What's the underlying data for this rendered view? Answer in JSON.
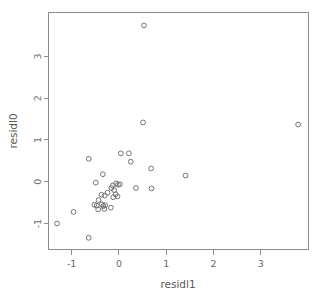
{
  "chart_data": {
    "type": "scatter",
    "title": "",
    "xlabel": "residl1",
    "ylabel": "residl0",
    "xlim": [
      -1.49,
      4.01
    ],
    "ylim": [
      -1.62,
      4.05
    ],
    "xticks": [
      -1,
      0,
      1,
      2,
      3
    ],
    "xtick_labels": [
      "-1",
      "0",
      "1",
      "2",
      "3"
    ],
    "yticks": [
      -1,
      0,
      1,
      2,
      3
    ],
    "ytick_labels": [
      "-1",
      "0",
      "1",
      "2",
      "3"
    ],
    "grid": false,
    "legend": null,
    "marker": "open-circle",
    "marker_color": "#6e6e6e",
    "n_points": 35,
    "points": [
      {
        "x": 0.53,
        "y": 3.74
      },
      {
        "x": 3.79,
        "y": 1.37
      },
      {
        "x": 0.51,
        "y": 1.42
      },
      {
        "x": -0.64,
        "y": 0.55
      },
      {
        "x": 0.04,
        "y": 0.68
      },
      {
        "x": 0.21,
        "y": 0.68
      },
      {
        "x": 0.25,
        "y": 0.48
      },
      {
        "x": -0.34,
        "y": 0.18
      },
      {
        "x": 0.68,
        "y": 0.32
      },
      {
        "x": 1.41,
        "y": 0.15
      },
      {
        "x": -0.49,
        "y": -0.02
      },
      {
        "x": -0.13,
        "y": -0.09
      },
      {
        "x": -0.06,
        "y": -0.04
      },
      {
        "x": -0.02,
        "y": -0.07
      },
      {
        "x": 0.02,
        "y": -0.06
      },
      {
        "x": -0.16,
        "y": -0.15
      },
      {
        "x": -0.1,
        "y": -0.2
      },
      {
        "x": -0.24,
        "y": -0.26
      },
      {
        "x": -0.3,
        "y": -0.33
      },
      {
        "x": -0.37,
        "y": -0.31
      },
      {
        "x": -0.07,
        "y": -0.3
      },
      {
        "x": -0.03,
        "y": -0.35
      },
      {
        "x": -0.12,
        "y": -0.37
      },
      {
        "x": 0.36,
        "y": -0.15
      },
      {
        "x": 0.69,
        "y": -0.16
      },
      {
        "x": -0.43,
        "y": -0.44
      },
      {
        "x": -0.52,
        "y": -0.55
      },
      {
        "x": -0.47,
        "y": -0.57
      },
      {
        "x": -0.36,
        "y": -0.54
      },
      {
        "x": -0.33,
        "y": -0.58
      },
      {
        "x": -0.29,
        "y": -0.56
      },
      {
        "x": -0.44,
        "y": -0.66
      },
      {
        "x": -0.31,
        "y": -0.65
      },
      {
        "x": -0.17,
        "y": -0.62
      },
      {
        "x": -0.96,
        "y": -0.72
      },
      {
        "x": -1.31,
        "y": -1.0
      },
      {
        "x": -0.64,
        "y": -1.34
      }
    ]
  },
  "axes": {
    "x_title": "residl1",
    "y_title": "residl0"
  }
}
